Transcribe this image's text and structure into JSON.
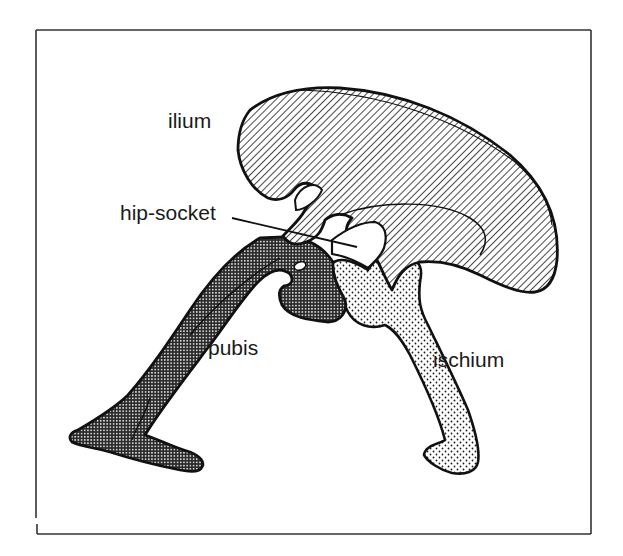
{
  "figure": {
    "labels": {
      "ilium": "ilium",
      "hip_socket": "hip-socket",
      "pubis": "pubis",
      "ischium": "ischium"
    },
    "parts": [
      {
        "name": "ilium",
        "fill_pattern": "diagonal-hatch"
      },
      {
        "name": "pubis",
        "fill_pattern": "dense-crosshatch"
      },
      {
        "name": "ischium",
        "fill_pattern": "dot-stipple"
      }
    ],
    "colors": {
      "ink": "#1a1a1a",
      "background": "#ffffff",
      "frame": "#333333"
    }
  }
}
